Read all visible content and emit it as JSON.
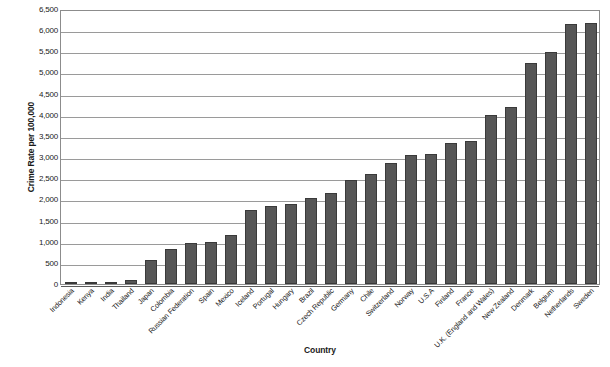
{
  "chart_data": {
    "type": "bar",
    "title": "",
    "xlabel": "Country",
    "ylabel": "Crime Rate per 100,000",
    "ylim": [
      0,
      6500
    ],
    "ytick_step": 500,
    "grid": true,
    "legend": "none",
    "bar_color": "#565656",
    "bar_border_color": "#3a3a3a",
    "gridline_color": "#9a9a9a",
    "plot_border_color": "#8c8c8c",
    "categories": [
      "Indonesia",
      "Kenya",
      "India",
      "Thailand",
      "Japan",
      "Colombia",
      "Russian Federation",
      "Spain",
      "Mexico",
      "Iceland",
      "Portugal",
      "Hungary",
      "Brazil",
      "Czech Republic",
      "Germany",
      "Chile",
      "Switzerland",
      "Norway",
      "U.S.A",
      "Finland",
      "France",
      "U.K. (England and Wales)",
      "New Zealand",
      "Denmark",
      "Belgium",
      "Netherlands",
      "Sweden"
    ],
    "values": [
      40,
      55,
      55,
      100,
      560,
      830,
      960,
      1000,
      1150,
      1760,
      1850,
      1880,
      2030,
      2150,
      2450,
      2600,
      2850,
      3050,
      3080,
      3330,
      3370,
      3990,
      4180,
      5220,
      5480,
      6150,
      6180
    ],
    "ytick_labels": [
      "0",
      "500",
      "1,000",
      "1,500",
      "2,000",
      "2,500",
      "3,000",
      "3,500",
      "4,000",
      "4,500",
      "5,000",
      "5,500",
      "6,000",
      "6,500"
    ],
    "ytick_values": [
      0,
      500,
      1000,
      1500,
      2000,
      2500,
      3000,
      3500,
      4000,
      4500,
      5000,
      5500,
      6000,
      6500
    ]
  }
}
